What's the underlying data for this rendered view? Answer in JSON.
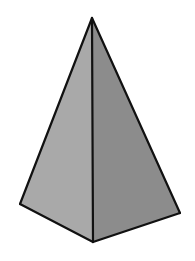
{
  "figure": {
    "faces": [
      {
        "name": "left-face",
        "shade": "light",
        "color": "#a9a9a9"
      },
      {
        "name": "right-face",
        "shade": "dark",
        "color": "#8c8c8c"
      }
    ],
    "edge_color": "#111111",
    "background_color": "#ffffff"
  }
}
